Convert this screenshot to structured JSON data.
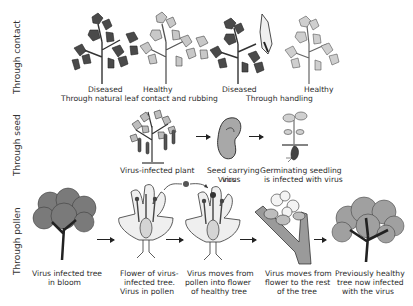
{
  "diagram": {
    "rows": [
      {
        "label": "Through contact",
        "groups": [
          {
            "plants": [
              "Diseased",
              "Healthy"
            ],
            "caption": "Through natural leaf contact and rubbing"
          },
          {
            "plants": [
              "Diseased",
              "Healthy"
            ],
            "caption": "Through handling"
          }
        ]
      },
      {
        "label": "Through seed",
        "steps": [
          {
            "caption_line1": "Virus-infected plant",
            "caption_line2": ""
          },
          {
            "caption_line1": "Seed carrying",
            "caption_line2": "virus"
          },
          {
            "caption_line1": "Germinating seedling",
            "caption_line2": "is infected with virus"
          }
        ]
      },
      {
        "label": "Through pollen",
        "annotation": "Virus",
        "steps": [
          {
            "caption_line1": "Virus infected tree",
            "caption_line2": "in bloom",
            "caption_line3": ""
          },
          {
            "caption_line1": "Flower of virus-",
            "caption_line2": "infected tree.",
            "caption_line3": "Virus in pollen"
          },
          {
            "caption_line1": "Virus moves from",
            "caption_line2": "pollen into flower",
            "caption_line3": "of healthy tree"
          },
          {
            "caption_line1": "Virus moves from",
            "caption_line2": "flower to the rest",
            "caption_line3": "of the tree"
          },
          {
            "caption_line1": "Previously healthy",
            "caption_line2": "tree now infected",
            "caption_line3": "with the virus"
          }
        ]
      }
    ],
    "colors": {
      "ink": "#222222",
      "diseased_leaf": "#4a4a4a",
      "healthy_leaf": "#bdbdbd",
      "background": "#ffffff"
    }
  }
}
